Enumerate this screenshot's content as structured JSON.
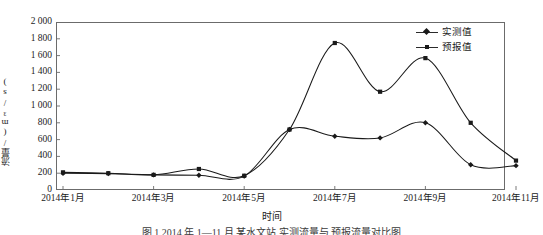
{
  "chart_data": {
    "type": "line",
    "title": "",
    "xlabel": "时间",
    "ylabel": "流量/(m³/s)",
    "ylim": [
      0,
      2000
    ],
    "ytick_step": 200,
    "grid": false,
    "legend_position": "top-right",
    "x": [
      "2014年1月",
      "2014年2月",
      "2014年3月",
      "2014年4月",
      "2014年5月",
      "2014年6月",
      "2014年7月",
      "2014年8月",
      "2014年9月",
      "2014年10月",
      "2014年11月"
    ],
    "categories": [
      "2014年1月",
      "2014年2月",
      "2014年3月",
      "2014年4月",
      "2014年5月",
      "2014年6月",
      "2014年7月",
      "2014年8月",
      "2014年9月",
      "2014年10月",
      "2014年11月"
    ],
    "xtick_labels": [
      "2014年1月",
      "2014年3月",
      "2014年5月",
      "2014年7月",
      "2014年9月",
      "2014年11月"
    ],
    "ytick_labels": [
      "2 000",
      "1 800",
      "1 600",
      "1 400",
      "1 200",
      "1 000",
      "800",
      "600",
      "400",
      "200",
      "0"
    ],
    "ytick_values": [
      2000,
      1800,
      1600,
      1400,
      1200,
      1000,
      800,
      600,
      400,
      200,
      0
    ],
    "series": [
      {
        "name": "实测值",
        "marker": "diamond",
        "color": "#1a1a1a",
        "values": [
          200,
          195,
          180,
          175,
          165,
          720,
          640,
          620,
          800,
          300,
          290
        ]
      },
      {
        "name": "预报值",
        "marker": "square",
        "color": "#1a1a1a",
        "values": [
          210,
          200,
          180,
          250,
          170,
          720,
          1750,
          1170,
          1570,
          800,
          350
        ]
      }
    ],
    "annotations": []
  },
  "legend": {
    "items": [
      {
        "label": "实测值"
      },
      {
        "label": "预报值"
      }
    ]
  },
  "axes": {
    "x_title": "时间",
    "y_title": "流量/(m³/s)"
  },
  "caption": {
    "text": "图 1   2014 年 1—11 月 某水文站 实测流量与 预报流量对比图"
  },
  "colors": {
    "line": "#2b2b2b",
    "marker": "#1a1a1a",
    "frame": "#6b6b6b",
    "text": "#1c1c1c"
  }
}
